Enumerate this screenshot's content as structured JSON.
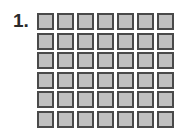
{
  "problem": {
    "number_label": "1.",
    "grid": {
      "rows": 6,
      "columns": 7,
      "total_cells": 42,
      "cell_fill": "#c0c0c0",
      "cell_border": "#4a4a4a"
    }
  }
}
